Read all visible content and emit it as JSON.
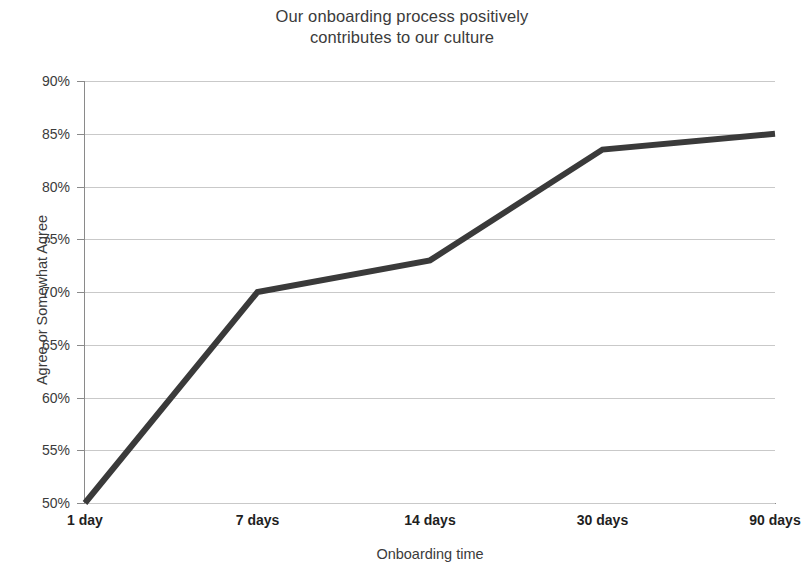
{
  "chart_data": {
    "type": "line",
    "title": "Our onboarding process positively contributes to our culture",
    "title_line1": "Our onboarding process positively",
    "title_line2": "contributes to our culture",
    "xlabel": "Onboarding time",
    "ylabel": "Agree or Somewhat Agree",
    "categories": [
      "1 day",
      "7 days",
      "14 days",
      "30 days",
      "90 days"
    ],
    "values": [
      50,
      70,
      73,
      83.5,
      85
    ],
    "value_labels": [
      "50%",
      "70%",
      "73%",
      "83.5%",
      "85%"
    ],
    "ylim": [
      50,
      90
    ],
    "ytick_values": [
      90,
      85,
      80,
      75,
      70,
      65,
      60,
      55,
      50
    ],
    "ytick_labels": [
      "90%",
      "85%",
      "80%",
      "75%",
      "70%",
      "65%",
      "60%",
      "55%",
      "50%"
    ],
    "grid": true,
    "legend": false,
    "series": [
      {
        "name": "Agree or Somewhat Agree",
        "values": [
          50,
          70,
          73,
          83.5,
          85
        ],
        "color": "#3a3a3a"
      }
    ],
    "colors": {
      "line": "#3a3a3a",
      "gridline": "#c9c9c9",
      "axis": "#8a8a8a",
      "text": "#3b3b3b",
      "background": "#ffffff"
    }
  }
}
